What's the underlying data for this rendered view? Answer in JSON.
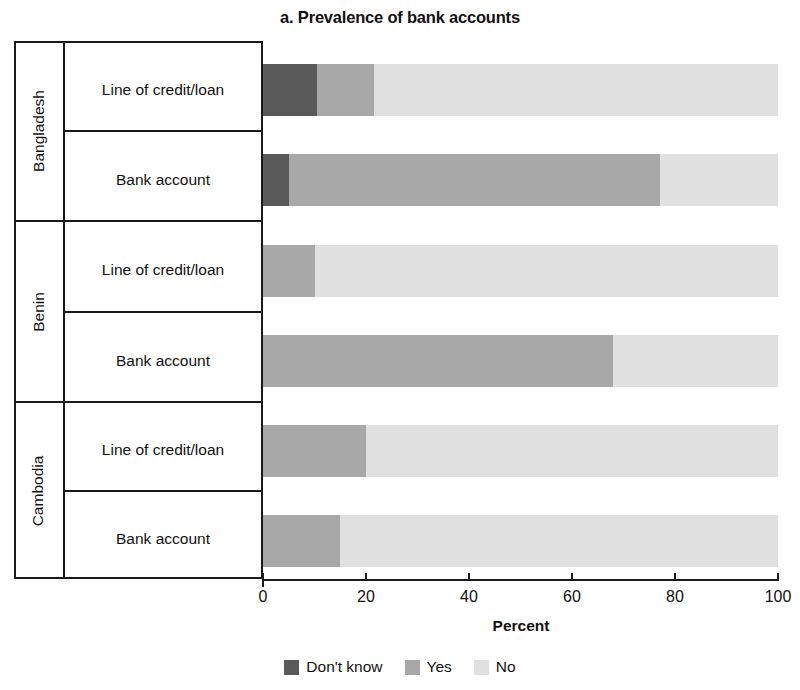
{
  "chart_data": {
    "type": "bar",
    "orientation": "horizontal",
    "stacked": true,
    "title": "a. Prevalence of bank accounts",
    "xlabel": "Percent",
    "ylabel": "",
    "xlim": [
      0,
      100
    ],
    "xticks": [
      0,
      20,
      40,
      60,
      80,
      100
    ],
    "xtick_labels": [
      "0",
      "20",
      "40",
      "60",
      "80",
      "100"
    ],
    "grid": false,
    "legend_position": "bottom-center",
    "legend": [
      "Don't know",
      "Yes",
      "No"
    ],
    "series": [
      {
        "name": "Don't know",
        "color": "#595959",
        "values": [
          10.5,
          5,
          0,
          0,
          0,
          0
        ]
      },
      {
        "name": "Yes",
        "color": "#a8a8a8",
        "values": [
          11,
          72,
          10,
          68,
          20,
          15
        ]
      },
      {
        "name": "No",
        "color": "#e0e0e0",
        "values": [
          78.5,
          23,
          90,
          32,
          80,
          85
        ]
      }
    ],
    "categories": [
      "Bangladesh - Line of credit/loan",
      "Bangladesh - Bank account",
      "Benin - Line of credit/loan",
      "Benin - Bank account",
      "Cambodia - Line of credit/loan",
      "Cambodia - Bank account"
    ],
    "groups": [
      {
        "country": "Bangladesh",
        "rows": [
          {
            "label": "Line of credit/loan",
            "dont_know": 10.5,
            "yes": 11,
            "no": 78.5
          },
          {
            "label": "Bank account",
            "dont_know": 5,
            "yes": 72,
            "no": 23
          }
        ]
      },
      {
        "country": "Benin",
        "rows": [
          {
            "label": "Line of credit/loan",
            "dont_know": 0,
            "yes": 10,
            "no": 90
          },
          {
            "label": "Bank account",
            "dont_know": 0,
            "yes": 68,
            "no": 32
          }
        ]
      },
      {
        "country": "Cambodia",
        "rows": [
          {
            "label": "Line of credit/loan",
            "dont_know": 0,
            "yes": 20,
            "no": 80
          },
          {
            "label": "Bank account",
            "dont_know": 0,
            "yes": 15,
            "no": 85
          }
        ]
      }
    ]
  },
  "legend": {
    "items": [
      {
        "label": "Don't know",
        "color": "#595959"
      },
      {
        "label": "Yes",
        "color": "#a8a8a8"
      },
      {
        "label": "No",
        "color": "#e0e0e0"
      }
    ]
  }
}
